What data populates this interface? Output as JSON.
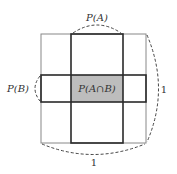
{
  "diagram": {
    "labels": {
      "pa": "P(A)",
      "pb": "P(B)",
      "pab": "P(A∩B)",
      "width_one": "1",
      "height_one": "1"
    },
    "colors": {
      "thin_border": "#888888",
      "thick_border": "#2a2a2a",
      "intersection_fill": "#bdbdbd",
      "dashed": "#444444"
    }
  }
}
